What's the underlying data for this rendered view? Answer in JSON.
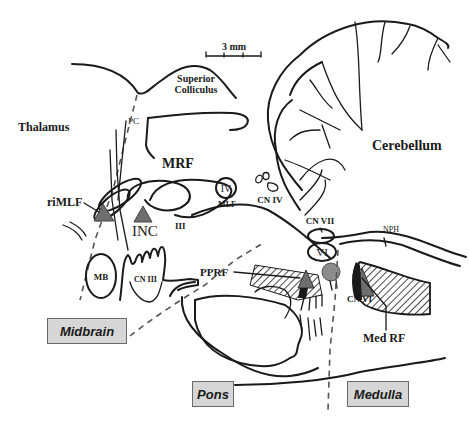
{
  "figure": {
    "scale_bar": "3 mm",
    "colors": {
      "line": "#1a1a1a",
      "premotor_triangle": "#6e6e6e",
      "abducens_nucleus_fill": "#8c8c8c",
      "region_box_fill": "#d6d6d6",
      "dashed_boundary": "#555555"
    },
    "labels": {
      "superior_colliculus_1": "Superior",
      "superior_colliculus_2": "Colliculus",
      "thalamus": "Thalamus",
      "pc": "PC",
      "mrf": "MRF",
      "rimlf": "riMLF",
      "inc": "INC",
      "iii": "III",
      "iv": "IV",
      "mlf": "MLF",
      "cn_iv": "CN IV",
      "cerebellum": "Cerebellum",
      "cn_vii": "CN VII",
      "nph": "NPH",
      "pprf": "PPRF",
      "vi": "VI",
      "cn_vi": "CN VI",
      "med_rf": "Med RF",
      "mb": "MB",
      "cn_iii": "CN III"
    },
    "regions": {
      "midbrain": "Midbrain",
      "pons": "Pons",
      "medulla": "Medulla"
    }
  }
}
